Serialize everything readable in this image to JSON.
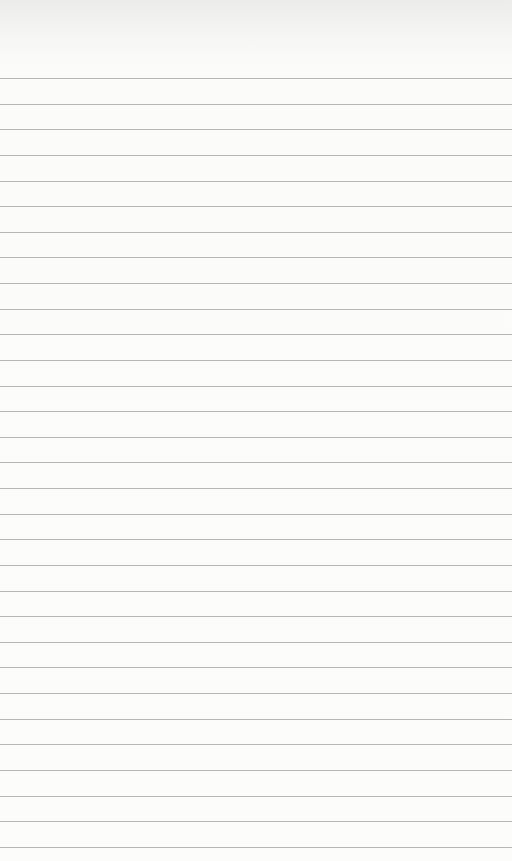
{
  "page": {
    "type": "blank lined notebook paper",
    "line_count": 31,
    "first_line_y": 78,
    "line_spacing": 25.63,
    "colors": {
      "paper": "#fcfcfb",
      "line": "#a9a9a7"
    }
  }
}
